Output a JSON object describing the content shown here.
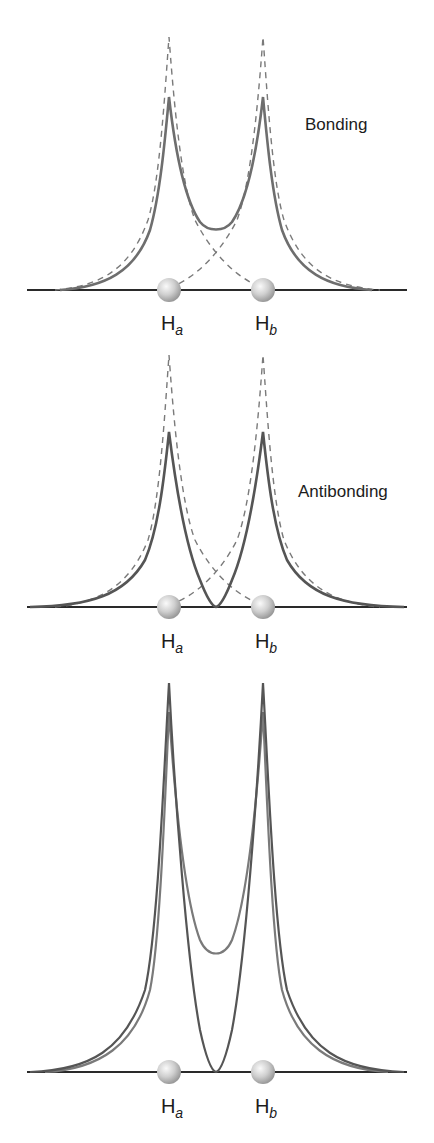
{
  "panels": [
    {
      "id": "bonding",
      "title": "Bonding",
      "atoms": [
        {
          "symbol": "H",
          "sub": "a"
        },
        {
          "symbol": "H",
          "sub": "b"
        }
      ],
      "curves": [
        "atomic orbital a (dashed)",
        "atomic orbital b (dashed)",
        "bonding combination (solid)"
      ]
    },
    {
      "id": "antibonding",
      "title": "Antibonding",
      "atoms": [
        {
          "symbol": "H",
          "sub": "a"
        },
        {
          "symbol": "H",
          "sub": "b"
        }
      ],
      "curves": [
        "atomic orbital a (dashed)",
        "atomic orbital b (dashed)",
        "antibonding combination (solid)"
      ]
    },
    {
      "id": "comparison",
      "title": "",
      "atoms": [
        {
          "symbol": "H",
          "sub": "a"
        },
        {
          "symbol": "H",
          "sub": "b"
        }
      ],
      "curves": [
        "bonding combination",
        "antibonding combination"
      ]
    }
  ],
  "colors": {
    "solid_curve": "#6e6e6e",
    "dashed_curve": "#7a7a7a",
    "baseline": "#2a2a2a",
    "atom": "#c8c8c8",
    "text": "#1c1c1c"
  }
}
